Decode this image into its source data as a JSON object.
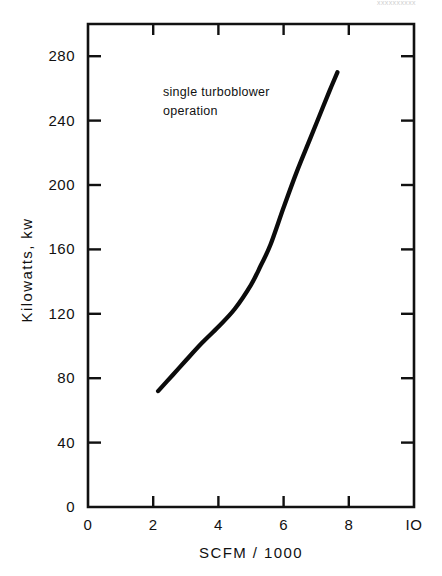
{
  "page": {
    "header_faint_text": "xxxxxxxxxx"
  },
  "chart_data": {
    "type": "line",
    "title": "",
    "subtitle": "",
    "xlabel": "SCFM / 1000",
    "ylabel": "Kilowatts, kw",
    "xlim": [
      0,
      10
    ],
    "ylim": [
      0,
      300
    ],
    "xticks": [
      0,
      2,
      4,
      6,
      8,
      10
    ],
    "xtick_labels": [
      "0",
      "2",
      "4",
      "6",
      "8",
      "IO"
    ],
    "yticks": [
      0,
      40,
      80,
      120,
      160,
      200,
      240,
      280
    ],
    "ytick_labels": [
      "0",
      "40",
      "80",
      "120",
      "160",
      "200",
      "240",
      "280"
    ],
    "grid": false,
    "legend_position": "none",
    "annotations": [
      {
        "name": "operation-mode-note",
        "line1": "single  turboblower",
        "line2": "operation",
        "x": 2.3,
        "y": 255
      }
    ],
    "series": [
      {
        "name": "single turboblower power curve",
        "color": "#0b0b0b",
        "x": [
          2.15,
          2.6,
          3.0,
          3.5,
          4.0,
          4.5,
          5.0,
          5.3,
          5.6,
          6.0,
          6.4,
          6.8,
          7.1,
          7.4,
          7.65
        ],
        "y": [
          72,
          82,
          91,
          102,
          112,
          123,
          138,
          150,
          163,
          186,
          208,
          228,
          243,
          258,
          270
        ]
      }
    ]
  }
}
